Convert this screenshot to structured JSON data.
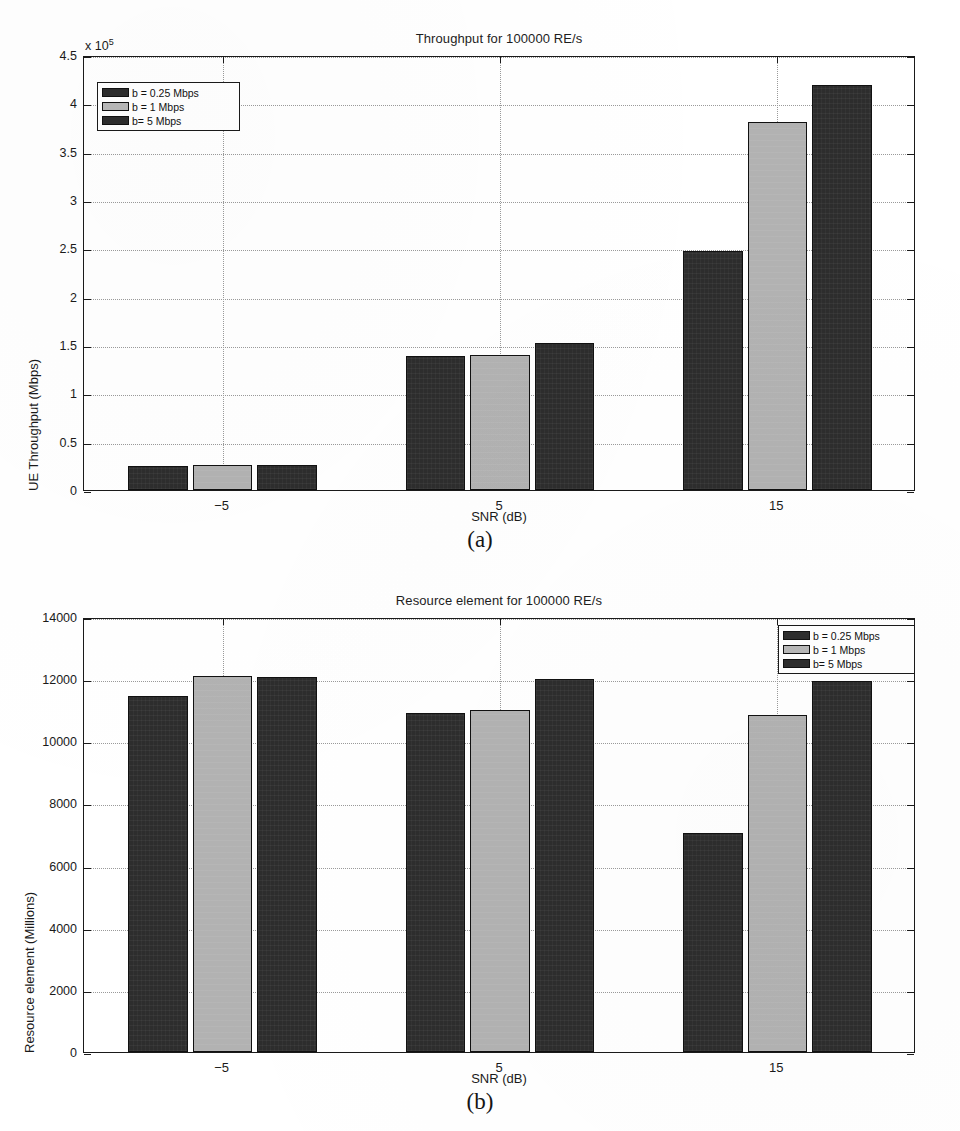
{
  "figure": {
    "subfigure_labels": [
      "(a)",
      "(b)"
    ],
    "colors": {
      "series_dark": "#2d2d2d",
      "series_light": "#b2b2b2",
      "axis": "#1a1a1a",
      "grid": "#9a9a9a",
      "background": "#ffffff"
    }
  },
  "chart_data": [
    {
      "type": "bar",
      "title": "Throughput for 100000 RE/s",
      "xlabel": "SNR (dB)",
      "ylabel": "UE Throughput (Mbps)",
      "y_exponent_label": "x 10",
      "y_exponent_power": "5",
      "categories": [
        "-5",
        "5",
        "15"
      ],
      "xtick_labels": [
        "−5",
        "5",
        "15"
      ],
      "ylim": [
        0,
        4.5
      ],
      "ytick_labels": [
        "0",
        "0.5",
        "1",
        "1.5",
        "2",
        "2.5",
        "3",
        "3.5",
        "4",
        "4.5"
      ],
      "ytick_values": [
        0,
        0.5,
        1,
        1.5,
        2,
        2.5,
        3,
        3.5,
        4,
        4.5
      ],
      "grid": true,
      "legend_position": "upper-left",
      "series": [
        {
          "name": "b = 0.25 Mbps",
          "style": "dark",
          "values": [
            0.25,
            1.39,
            2.47
          ]
        },
        {
          "name": "b = 1 Mbps",
          "style": "light",
          "values": [
            0.26,
            1.4,
            3.81
          ]
        },
        {
          "name": "b= 5 Mbps",
          "style": "dark",
          "values": [
            0.26,
            1.52,
            4.19
          ]
        }
      ]
    },
    {
      "type": "bar",
      "title": "Resource element for 100000 RE/s",
      "xlabel": "SNR (dB)",
      "ylabel": "Resource element (Millions)",
      "categories": [
        "-5",
        "5",
        "15"
      ],
      "xtick_labels": [
        "−5",
        "5",
        "15"
      ],
      "ylim": [
        0,
        14000
      ],
      "ytick_labels": [
        "0",
        "2000",
        "4000",
        "6000",
        "8000",
        "10000",
        "12000",
        "14000"
      ],
      "ytick_values": [
        0,
        2000,
        4000,
        6000,
        8000,
        10000,
        12000,
        14000
      ],
      "grid": true,
      "legend_position": "upper-right",
      "series": [
        {
          "name": "b = 0.25 Mbps",
          "style": "dark",
          "values": [
            11450,
            10900,
            7050
          ]
        },
        {
          "name": "b = 1 Mbps",
          "style": "light",
          "values": [
            12100,
            11000,
            10850
          ]
        },
        {
          "name": "b= 5 Mbps",
          "style": "dark",
          "values": [
            12080,
            12000,
            11950
          ]
        }
      ]
    }
  ]
}
